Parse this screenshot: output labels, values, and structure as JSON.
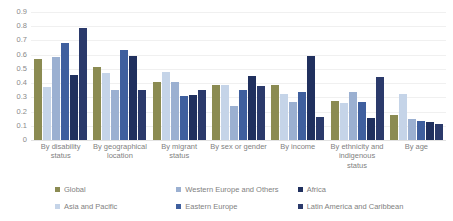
{
  "chart_data": {
    "type": "bar",
    "title": "",
    "subtitle": "",
    "xlabel": "",
    "ylabel": "",
    "ylim": [
      0,
      0.9
    ],
    "grid": true,
    "legend_position": "bottom",
    "ytick_labels": [
      "0.9",
      "0.8",
      "0.7",
      "0.6",
      "0.5",
      "0.4",
      "0.3",
      "0.2",
      "0.1",
      "0"
    ],
    "ytick_values": [
      0.9,
      0.8,
      0.7,
      0.6,
      0.5,
      0.4,
      0.3,
      0.2,
      0.1,
      0
    ],
    "categories": [
      "By disability status",
      "By geographical location",
      "By migrant status",
      "By sex or gender",
      "By income",
      "By ethnicity and indigenous status",
      "By age"
    ],
    "series": [
      {
        "name": "Global",
        "color": "#8b8b52",
        "values": [
          0.57,
          0.51,
          0.405,
          0.385,
          0.385,
          0.275,
          0.175
        ]
      },
      {
        "name": "Asia and Pacific",
        "color": "#c5d4e8",
        "values": [
          0.37,
          0.47,
          0.475,
          0.39,
          0.325,
          0.26,
          0.325
        ]
      },
      {
        "name": "Western Europe and Others",
        "color": "#9bb0d1",
        "values": [
          0.585,
          0.35,
          0.41,
          0.24,
          0.265,
          0.34,
          0.15
        ]
      },
      {
        "name": "Eastern Europe",
        "color": "#3f5f9e",
        "values": [
          0.685,
          0.63,
          0.31,
          0.355,
          0.34,
          0.27,
          0.135
        ]
      },
      {
        "name": "Africa",
        "color": "#20305e",
        "values": [
          0.455,
          0.59,
          0.315,
          0.45,
          0.59,
          0.155,
          0.13
        ]
      },
      {
        "name": "Latin America and Caribbean",
        "color": "#2b3a6b",
        "values": [
          0.785,
          0.355,
          0.355,
          0.38,
          0.165,
          0.44,
          0.115
        ]
      }
    ]
  }
}
